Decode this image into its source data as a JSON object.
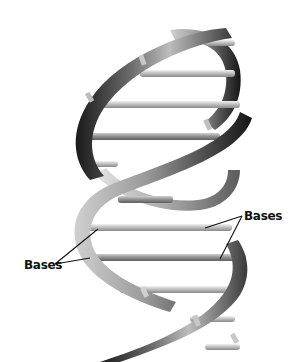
{
  "figure": {
    "labels": [
      {
        "id": "right",
        "text": "Bases"
      },
      {
        "id": "left",
        "text": "Bases"
      }
    ]
  },
  "colors": {
    "background": "#ffffff",
    "strand_dark": "#1e1e1e",
    "strand_mid": "#7a7a7a",
    "strand_light": "#d8d8d8",
    "base_rung": "#c8c8c8",
    "label_text": "#111111",
    "leader_line": "#111111"
  }
}
